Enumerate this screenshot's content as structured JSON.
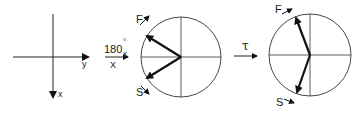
{
  "diagram": {
    "axes": {
      "y_label": "y",
      "x_label": "x"
    },
    "pulse": {
      "angle": "180",
      "degree_mark": "°",
      "subscript": "x",
      "axis_label": "X"
    },
    "evolution": {
      "label": "τ"
    },
    "circle1": {
      "fast_label": "F",
      "slow_label": "S"
    },
    "circle2": {
      "fast_label": "F",
      "slow_label": "S"
    },
    "colors": {
      "line": "#222222",
      "vector": "#111111",
      "background": "#ffffff"
    }
  }
}
